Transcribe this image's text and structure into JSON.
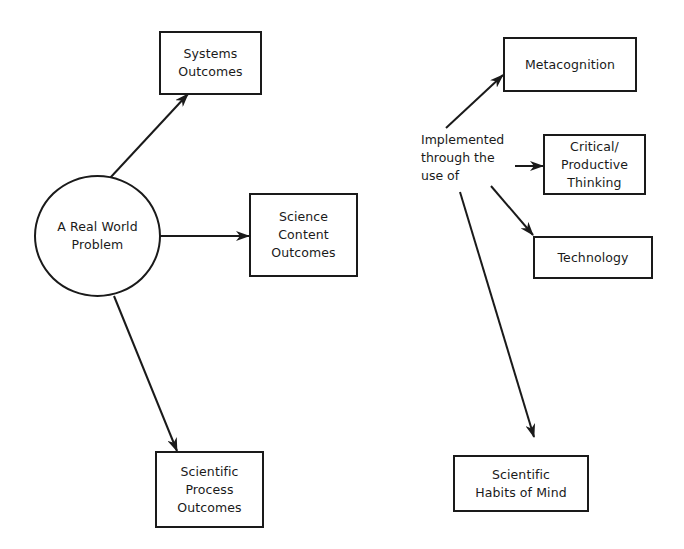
{
  "diagram": {
    "central_node": {
      "label": "A Real World\nProblem",
      "shape": "circle"
    },
    "outcome_nodes": [
      {
        "id": "systems",
        "label": "Systems\nOutcomes"
      },
      {
        "id": "science-content",
        "label": "Science\nContent\nOutcomes"
      },
      {
        "id": "scientific-process",
        "label": "Scientific\nProcess\nOutcomes"
      }
    ],
    "implementation_label": "Implemented\nthrough the\nuse of",
    "implementation_nodes": [
      {
        "id": "metacognition",
        "label": "Metacognition"
      },
      {
        "id": "critical-thinking",
        "label": "Critical/\nProductive\nThinking"
      },
      {
        "id": "technology",
        "label": "Technology"
      },
      {
        "id": "habits-of-mind",
        "label": "Scientific\nHabits of Mind"
      }
    ],
    "edges": [
      {
        "from": "A Real World Problem",
        "to": "Systems Outcomes"
      },
      {
        "from": "A Real World Problem",
        "to": "Science Content Outcomes"
      },
      {
        "from": "A Real World Problem",
        "to": "Scientific Process Outcomes"
      },
      {
        "from": "Implemented through the use of",
        "to": "Metacognition"
      },
      {
        "from": "Implemented through the use of",
        "to": "Critical/Productive Thinking"
      },
      {
        "from": "Implemented through the use of",
        "to": "Technology"
      },
      {
        "from": "Implemented through the use of",
        "to": "Scientific Habits of Mind"
      }
    ],
    "colors": {
      "stroke": "#1a1a1a",
      "background": "#ffffff"
    }
  }
}
